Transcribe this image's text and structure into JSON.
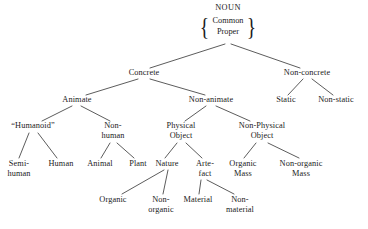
{
  "diagram": {
    "type": "taxonomy-tree",
    "line_color": "#4a4a4a",
    "text_color": "#1a1a1a",
    "background": "#ffffff",
    "root": {
      "label": "NOUN",
      "bracket_items": [
        "Common",
        "Proper"
      ],
      "open_brace": "{",
      "close_brace": "}"
    },
    "nodes": {
      "concrete": "Concrete",
      "non_concrete": "Non-concrete",
      "animate": "Animate",
      "non_animate": "Non-animate",
      "static": "Static",
      "non_static": "Non-static",
      "humanoid": "“Humanoid”",
      "non_human_l1": "Non-",
      "non_human_l2": "human",
      "physical_object_l1": "Physical",
      "physical_object_l2": "Object",
      "non_physical_object_l1": "Non-Physical",
      "non_physical_object_l2": "Object",
      "semi_human_l1": "Semi-",
      "semi_human_l2": "human",
      "human": "Human",
      "animal": "Animal",
      "plant": "Plant",
      "nature": "Nature",
      "artefact_l1": "Arte-",
      "artefact_l2": "fact",
      "organic_mass_l1": "Organic",
      "organic_mass_l2": "Mass",
      "non_organic_mass_l1": "Non-organic",
      "non_organic_mass_l2": "Mass",
      "organic": "Organic",
      "non_organic_l1": "Non-",
      "non_organic_l2": "organic",
      "material": "Material",
      "non_material_l1": "Non-",
      "non_material_l2": "material"
    }
  }
}
